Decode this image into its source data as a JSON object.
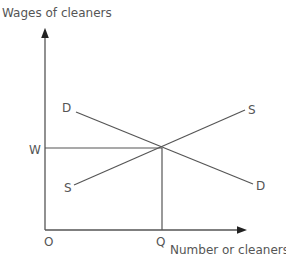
{
  "diagram": {
    "type": "supply-demand",
    "y_axis_label": "Wages of cleaners",
    "x_axis_label": "Number or cleaners",
    "origin_label": "O",
    "equilibrium_wage_label": "W",
    "equilibrium_quantity_label": "Q",
    "demand_curve": {
      "start_label": "D",
      "end_label": "D"
    },
    "supply_curve": {
      "start_label": "S",
      "end_label": "S"
    },
    "colors": {
      "line": "#555555",
      "text": "#555555",
      "background": "#ffffff"
    }
  }
}
